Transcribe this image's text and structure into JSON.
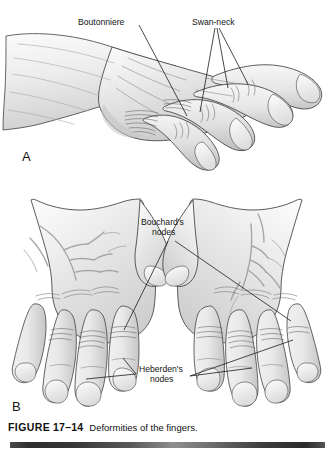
{
  "figure": {
    "caption_label": "FIGURE",
    "caption_number": "17–14",
    "caption_text": "Deformities of the fingers."
  },
  "panels": [
    {
      "id": "A",
      "letter": "A",
      "view": "lateral view of a hand and forearm",
      "labels": [
        {
          "name": "boutonniere",
          "text": "Boutonniere",
          "leaders": 1
        },
        {
          "name": "swan-neck",
          "text": "Swan-neck",
          "leaders": 3
        }
      ]
    },
    {
      "id": "B",
      "letter": "B",
      "view": "dorsal view of both hands",
      "labels": [
        {
          "name": "bouchards-nodes",
          "line1": "Bouchard's",
          "line2": "nodes",
          "leaders": 2
        },
        {
          "name": "heberdens-nodes",
          "line1": "Heberden's",
          "line2": "nodes",
          "leaders": 3
        }
      ]
    }
  ],
  "colors": {
    "skin_light": "#f2f2f2",
    "skin_mid": "#e2e2e2",
    "skin_shadow": "#c9c9c9",
    "outline": "#3b3b3b",
    "vein": "#9a9a9a",
    "crease": "#6f6f6f",
    "leader": "#1d1d1d",
    "text": "#141414",
    "background": "#ffffff",
    "rule_dark": "#2e2e2e",
    "rule_light": "#8e8e8e"
  }
}
